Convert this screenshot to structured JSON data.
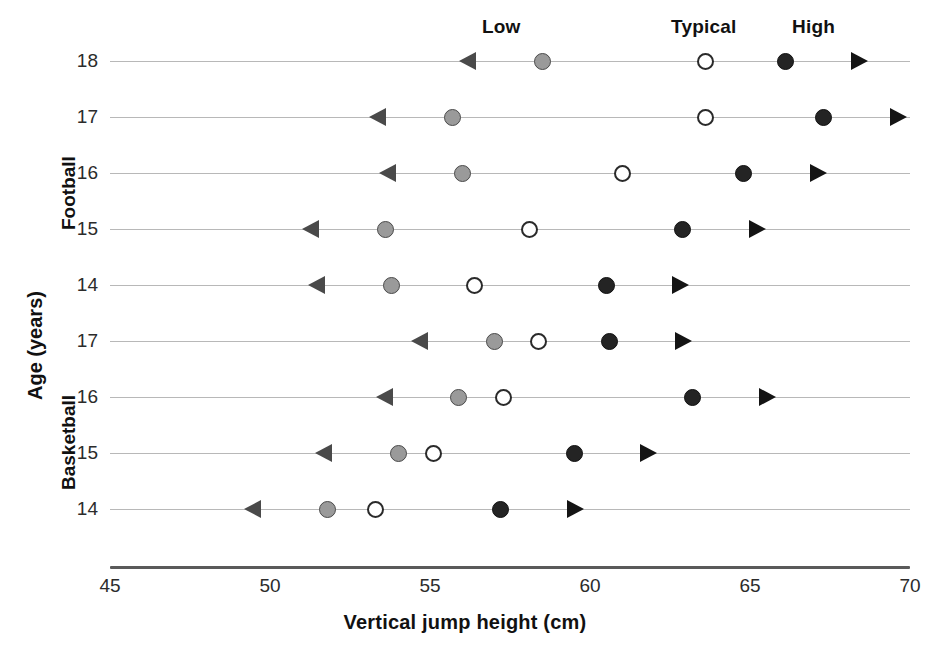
{
  "chart_data": {
    "type": "scatter",
    "title": "",
    "xlabel": "Vertical jump height (cm)",
    "ylabel": "Age (years)",
    "xlim": [
      45,
      70
    ],
    "xticks": [
      45,
      50,
      55,
      60,
      65,
      70
    ],
    "xtick_labels": [
      "45",
      "50",
      "55",
      "60",
      "65",
      "70"
    ],
    "grid": true,
    "legend_position": "top",
    "legend": [
      {
        "key": "low",
        "label": "Low",
        "marker": "filled-gray-circle-with-left-arrow",
        "color": "#9a9a9a"
      },
      {
        "key": "typical",
        "label": "Typical",
        "marker": "open-circle",
        "color": "#ffffff"
      },
      {
        "key": "high",
        "label": "High",
        "marker": "filled-black-circle-with-right-arrow",
        "color": "#242424"
      }
    ],
    "series": [
      {
        "name": "Low",
        "values": [
          58.5,
          55.7,
          56.0,
          53.6,
          53.8,
          57.0,
          55.9,
          54.0,
          51.8
        ]
      },
      {
        "name": "Typical",
        "values": [
          63.6,
          63.6,
          61.0,
          58.1,
          56.4,
          58.4,
          57.3,
          55.1,
          53.3
        ]
      },
      {
        "name": "High",
        "values": [
          66.1,
          67.3,
          64.8,
          62.9,
          60.5,
          60.6,
          63.2,
          59.5,
          57.2
        ]
      }
    ],
    "groups": [
      {
        "name": "Football",
        "rows": [
          {
            "age": "18",
            "low": 58.5,
            "typical": 63.6,
            "high": 66.1
          },
          {
            "age": "17",
            "low": 55.7,
            "typical": 63.6,
            "high": 67.3
          },
          {
            "age": "16",
            "low": 56.0,
            "typical": 61.0,
            "high": 64.8
          },
          {
            "age": "15",
            "low": 53.6,
            "typical": 58.1,
            "high": 62.9
          },
          {
            "age": "14",
            "low": 53.8,
            "typical": 56.4,
            "high": 60.5
          }
        ]
      },
      {
        "name": "Basketball",
        "rows": [
          {
            "age": "17",
            "low": 57.0,
            "typical": 58.4,
            "high": 60.6
          },
          {
            "age": "16",
            "low": 55.9,
            "typical": 57.3,
            "high": 63.2
          },
          {
            "age": "15",
            "low": 54.0,
            "typical": 55.1,
            "high": 59.5
          },
          {
            "age": "14",
            "low": 51.8,
            "typical": 53.3,
            "high": 57.2
          }
        ]
      }
    ]
  },
  "layout": {
    "plot_left_px": 110,
    "plot_right_px": 910,
    "px_per_unit": 32,
    "first_row_center_y": 62,
    "row_spacing": 56,
    "arrow_length_units": 2.6
  },
  "legend_labels": {
    "low": "Low",
    "typical": "Typical",
    "high": "High"
  },
  "axis_titles": {
    "x": "Vertical jump height (cm)",
    "y": "Age (years)"
  }
}
